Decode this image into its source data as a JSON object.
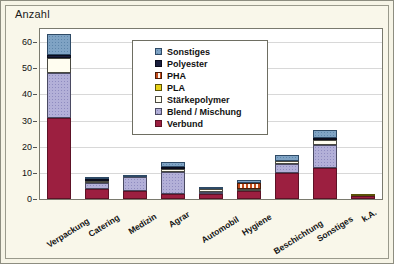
{
  "axis_title": "Anzahl",
  "legend": {
    "entries": [
      {
        "label": "Sonstiges",
        "color": "#7fa3c4",
        "cls": "s-sonstiges"
      },
      {
        "label": "Polyester",
        "color": "#1a1f3d",
        "cls": "s-polyester"
      },
      {
        "label": "PHA",
        "color": "#c44a1a",
        "cls": "s-pha"
      },
      {
        "label": "PLA",
        "color": "#e8d117",
        "cls": "s-pla"
      },
      {
        "label": "Stärkepolymer",
        "color": "#fffdf0",
        "cls": "s-staerke"
      },
      {
        "label": "Blend / Mischung",
        "color": "#b3b0d8",
        "cls": "s-blend"
      },
      {
        "label": "Verbund",
        "color": "#9c1f40",
        "cls": "s-verbund"
      }
    ]
  },
  "chart_data": {
    "type": "bar",
    "stacked": true,
    "title": "",
    "xlabel": "",
    "ylabel": "Anzahl",
    "ylim": [
      0,
      65
    ],
    "yticks": [
      0,
      10,
      20,
      30,
      40,
      50,
      60
    ],
    "grid": true,
    "legend_position": "inside-top-center",
    "categories": [
      "Verpackung",
      "Catering",
      "Medizin",
      "Agrar",
      "Automobil",
      "Hygiene",
      "Beschichtung",
      "Sonstiges",
      "k.A."
    ],
    "series": [
      {
        "name": "Verbund",
        "color": "#9c1f40",
        "values": [
          31,
          4,
          3,
          2,
          2,
          3,
          10,
          12,
          1
        ]
      },
      {
        "name": "Blend / Mischung",
        "color": "#b3b0d8",
        "values": [
          17,
          2,
          5.5,
          8.5,
          0.5,
          0,
          3.5,
          8.5,
          0
        ]
      },
      {
        "name": "Stärkepolymer",
        "color": "#fffdf0",
        "values": [
          6,
          1,
          0,
          1,
          1,
          0.5,
          1,
          2,
          0
        ]
      },
      {
        "name": "PLA",
        "color": "#e8d117",
        "values": [
          0,
          0,
          0,
          0,
          0,
          0,
          0,
          0,
          1
        ]
      },
      {
        "name": "PHA",
        "color": "#c44a1a",
        "values": [
          0,
          0,
          0,
          0,
          0,
          2.5,
          0,
          0,
          0
        ]
      },
      {
        "name": "Polyester",
        "color": "#1a1f3d",
        "values": [
          1,
          0.5,
          0,
          0.5,
          0,
          0,
          0,
          0.5,
          0
        ]
      },
      {
        "name": "Sonstiges",
        "color": "#7fa3c4",
        "values": [
          8,
          0.5,
          0.5,
          2,
          0.5,
          1,
          2.5,
          3,
          0
        ]
      }
    ],
    "totals": [
      63,
      8,
      9,
      14,
      4,
      7,
      17,
      26,
      2
    ]
  }
}
